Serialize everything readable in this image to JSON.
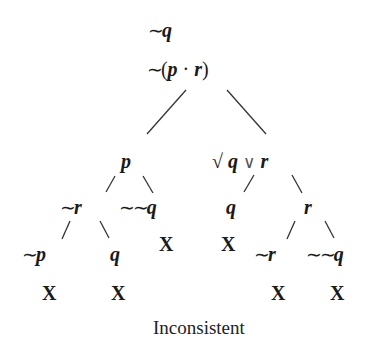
{
  "tree": {
    "premises": [
      {
        "id": "premise-1",
        "text": "~q",
        "tilde": "∼",
        "var": "q"
      },
      {
        "id": "premise-2",
        "text": "~(p · r)",
        "tilde": "∼",
        "open": "(",
        "var1": "p",
        "dot": "·",
        "var2": "r",
        "close": ")"
      }
    ],
    "nodes": {
      "p": {
        "text": "p",
        "var": "p"
      },
      "q_or_r": {
        "text": "√ q ∨ r",
        "check": "√",
        "var1": "q",
        "or": "∨",
        "var2": "r"
      },
      "not_r_left": {
        "text": "~r",
        "tilde": "∼",
        "var": "r"
      },
      "not_not_q_left": {
        "text": "~~q",
        "tilde": "∼∼",
        "var": "q"
      },
      "q_mid": {
        "text": "q",
        "var": "q"
      },
      "r_right": {
        "text": "r",
        "var": "r"
      },
      "not_p": {
        "text": "~p",
        "tilde": "∼",
        "var": "p"
      },
      "q_left": {
        "text": "q",
        "var": "q"
      },
      "not_r_right": {
        "text": "~r",
        "tilde": "∼",
        "var": "r"
      },
      "not_not_q_right": {
        "text": "~~q",
        "tilde": "∼∼",
        "var": "q"
      }
    },
    "closed_marker": "X",
    "closed_branches": [
      "~~q (left)",
      "q (mid)",
      "~p",
      "q (left)",
      "~r (right)",
      "~~q (right)"
    ],
    "result": "Inconsistent"
  }
}
